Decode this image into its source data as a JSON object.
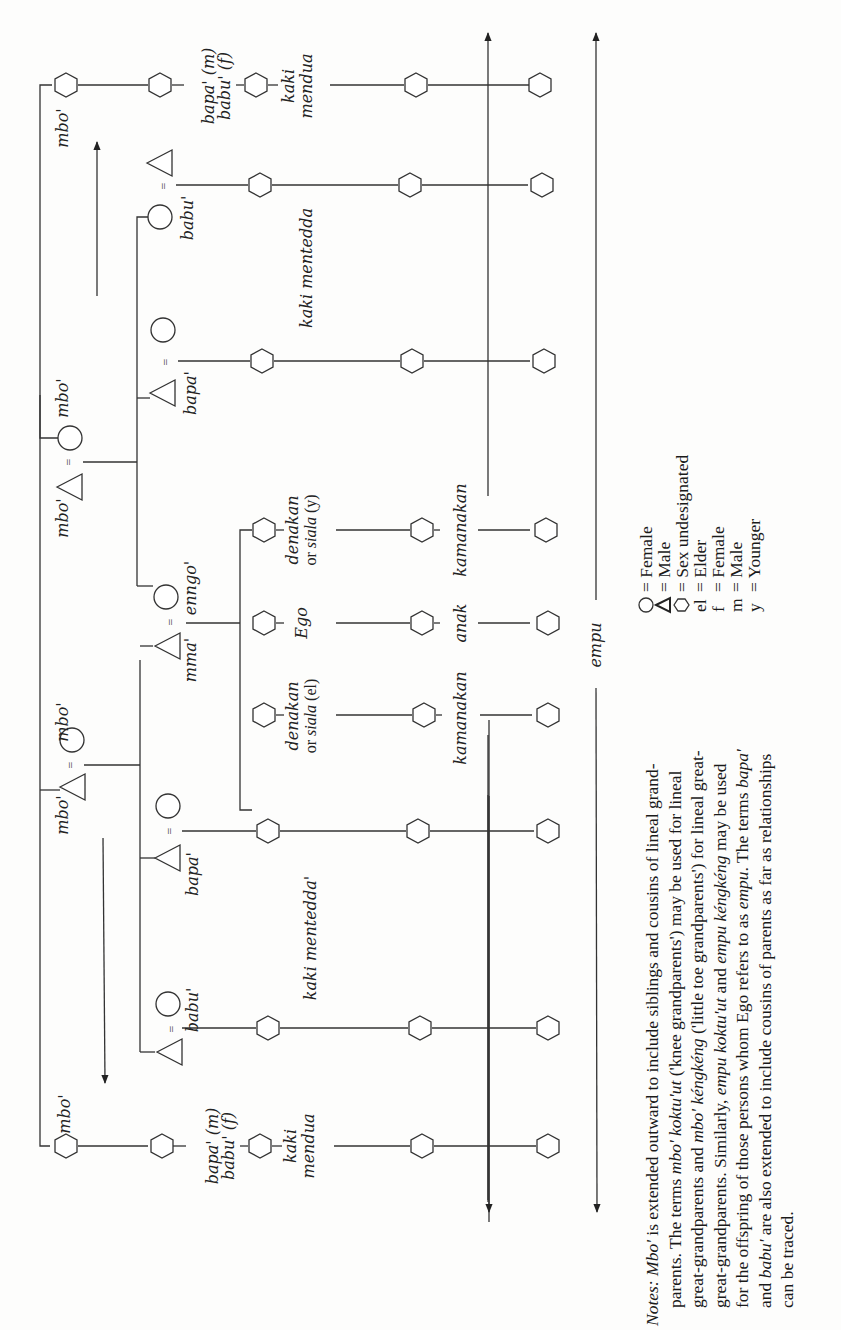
{
  "figure": {
    "orientation": "rotated-90-ccw",
    "generations": {
      "great_grandparents": {
        "left_term": "mbo'",
        "right_term": "mbo'"
      },
      "grandparents": {
        "left_couple": {
          "husband_term": "mbo'",
          "wife_term": "mbo'"
        },
        "right_couple": {
          "husband_term": "mbo'",
          "wife_term": "mbo'"
        }
      },
      "parents": {
        "father_term": "mma'",
        "mother_term": "enngo'",
        "aunt_term_left": "babu'",
        "uncle_term_left": "bapa'",
        "uncle_term_right": "bapa'",
        "aunt_term_right": "babu'",
        "parent_cousin_left": {
          "line1": "bapa' (m)",
          "line2": "babu' (f)"
        },
        "parent_cousin_right": {
          "line1": "bapa' (m)",
          "line2": "babu' (f)"
        }
      },
      "ego_generation": {
        "elder_sibling": {
          "line1": "denakan",
          "line2": "or siala (el)"
        },
        "ego": "Ego",
        "younger_sibling": {
          "line1": "denakan",
          "line2": "or siala (y)"
        },
        "cousins_left": "kaki mentedda'",
        "cousins_right": "kaki mentedda",
        "second_cousins_left": {
          "line1": "kaki",
          "line2": "mendua"
        },
        "second_cousins_right": {
          "line1": "kaki",
          "line2": "mendua"
        }
      },
      "children": {
        "left_term": "kamanakan",
        "ego_term": "anak",
        "right_term": "kamanakan"
      },
      "grandchildren": {
        "term": "empu"
      }
    },
    "arrows": {
      "mbo_left": "mbo'",
      "mbo_right": "mbo'"
    }
  },
  "legend": [
    {
      "symbol": "circle",
      "label": "= Female"
    },
    {
      "symbol": "triangle",
      "label": "= Male"
    },
    {
      "symbol": "hexagon",
      "label": "= Sex undesignated"
    },
    {
      "symbol": "el",
      "label": "= Elder"
    },
    {
      "symbol": "f",
      "label": "= Female"
    },
    {
      "symbol": "m",
      "label": "= Male"
    },
    {
      "symbol": "y",
      "label": "= Younger"
    }
  ],
  "notes": {
    "lines": [
      [
        {
          "t": "Notes:",
          "i": true
        },
        {
          "t": " "
        },
        {
          "t": "Mbo'",
          "i": true
        },
        {
          "t": " is extended outward to include siblings and cousins of lineal grand-"
        }
      ],
      [
        {
          "t": "parents. The terms "
        },
        {
          "t": "mbo' koktu'ut",
          "i": true
        },
        {
          "t": " ('knee grandparents') may be used for lineal"
        }
      ],
      [
        {
          "t": "great-grandparents and "
        },
        {
          "t": "mbo' kéngkéng",
          "i": true
        },
        {
          "t": " ('little toe grandparents') for lineal great-"
        }
      ],
      [
        {
          "t": "great-grandparents. Similarly, "
        },
        {
          "t": "empu koktu'ut",
          "i": true
        },
        {
          "t": " and "
        },
        {
          "t": "empu kéngkéng",
          "i": true
        },
        {
          "t": " may be used"
        }
      ],
      [
        {
          "t": "for the offspring of those persons whom Ego refers to as "
        },
        {
          "t": "empu",
          "i": true
        },
        {
          "t": ". The terms "
        },
        {
          "t": "bapa'",
          "i": true
        }
      ],
      [
        {
          "t": "and "
        },
        {
          "t": "babu'",
          "i": true
        },
        {
          "t": " are also extended to include cousins of parents as far as relationships"
        }
      ],
      [
        {
          "t": "can be traced."
        }
      ]
    ]
  }
}
